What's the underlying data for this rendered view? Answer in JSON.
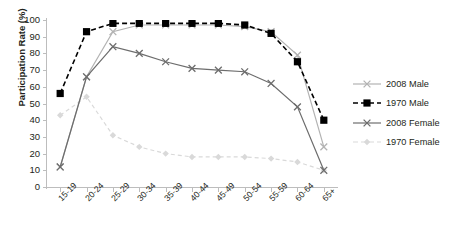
{
  "chart_data": {
    "type": "line",
    "title": "",
    "xlabel": "",
    "ylabel": "Participation Rate (%)",
    "ylim": [
      0,
      100
    ],
    "yticks": [
      0,
      10,
      20,
      30,
      40,
      50,
      60,
      70,
      80,
      90,
      100
    ],
    "grid": false,
    "legend_position": "right",
    "categories": [
      "15-19",
      "20-24",
      "25-29",
      "30-34",
      "35-39",
      "40-44",
      "45-49",
      "50-54",
      "55-59",
      "60-64",
      "65+"
    ],
    "series": [
      {
        "name": "2008 Male",
        "color": "#b3b3b3",
        "marker": "x",
        "dash": "solid",
        "values": [
          12,
          66,
          93,
          97,
          97,
          97,
          97,
          96,
          93,
          79,
          24
        ]
      },
      {
        "name": "1970 Male",
        "color": "#000000",
        "marker": "square",
        "dash": "dashed",
        "values": [
          56,
          93,
          98,
          98,
          98,
          98,
          98,
          97,
          92,
          75,
          40
        ]
      },
      {
        "name": "2008 Female",
        "color": "#6d6d6d",
        "marker": "x",
        "dash": "solid",
        "values": [
          12,
          66,
          84,
          80,
          75,
          71,
          70,
          69,
          62,
          48,
          10
        ]
      },
      {
        "name": "1970 Female",
        "color": "#d9d9d9",
        "marker": "diamond",
        "dash": "dashed",
        "values": [
          43,
          54,
          31,
          24,
          20,
          18,
          18,
          18,
          17,
          15,
          10
        ]
      }
    ]
  },
  "axes": {
    "y_label": "Participation Rate (%)",
    "y_tick_labels": [
      "100",
      "90",
      "80",
      "70",
      "60",
      "50",
      "40",
      "30",
      "20",
      "10",
      "0"
    ],
    "x_tick_labels": [
      "15-19",
      "20-24",
      "25-29",
      "30-34",
      "35-39",
      "40-44",
      "45-49",
      "50-54",
      "55-59",
      "60-64",
      "65+"
    ]
  },
  "legend": {
    "items": [
      {
        "label": "2008 Male"
      },
      {
        "label": "1970 Male"
      },
      {
        "label": "2008 Female"
      },
      {
        "label": "1970 Female"
      }
    ]
  }
}
